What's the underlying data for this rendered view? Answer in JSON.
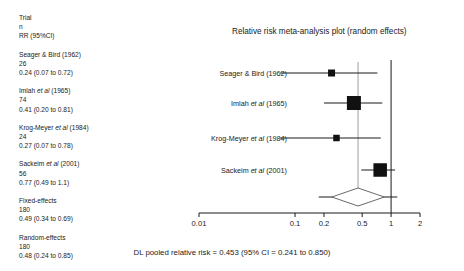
{
  "plot": {
    "title": "Relative risk meta-analysis plot (random effects)",
    "caption": "DL pooled relative risk = 0.453  (95% CI = 0.241 to 0.850)"
  },
  "legend": {
    "header": {
      "line1": "Trial",
      "line2": "n",
      "line3": "RR (95%CI)"
    },
    "entries": [
      {
        "name": "Seager & Bird (1962)",
        "n": "26",
        "rr": "0.24 (0.07 to 0.72)"
      },
      {
        "name": "Imlah et al (1965)",
        "n": "74",
        "rr": "0.41 (0.20 to 0.81)"
      },
      {
        "name": "Krog-Meyer et al (1984)",
        "n": "24",
        "rr": "0.27 (0.07 to 0.78)"
      },
      {
        "name": "Sackeim et al (2001)",
        "n": "56",
        "rr": "0.77 (0.49 to 1.1)"
      },
      {
        "name": "Fixed-effects",
        "n": "180",
        "rr": "0.49 (0.34 to 0.69)"
      },
      {
        "name": "Random-effects",
        "n": "180",
        "rr": "0.48 (0.24 to 0.85)"
      }
    ]
  },
  "chart_data": {
    "type": "forest",
    "title": "Relative risk meta-analysis plot (random effects)",
    "xlabel": "",
    "ylabel": "",
    "xscale": "log",
    "xlim": [
      0.01,
      2
    ],
    "grid": false,
    "null_line": 1,
    "tick_values": [
      0.01,
      0.1,
      0.2,
      0.5,
      1,
      2
    ],
    "tick_labels": [
      "0.01",
      "0.1",
      "0.2",
      "0.5",
      "1",
      "2"
    ],
    "measure": "Relative risk",
    "studies": [
      {
        "label": "Seager & Bird (1962)",
        "n": 26,
        "estimate": 0.24,
        "ci_low": 0.07,
        "ci_high": 0.72,
        "weight": 0.14
      },
      {
        "label": "Imlah et al (1965)",
        "n": 74,
        "estimate": 0.41,
        "ci_low": 0.2,
        "ci_high": 0.81,
        "weight": 0.38
      },
      {
        "label": "Krog-Meyer et al (1984)",
        "n": 24,
        "estimate": 0.27,
        "ci_low": 0.07,
        "ci_high": 0.78,
        "weight": 0.11
      },
      {
        "label": "Sackeim et al (2001)",
        "n": 56,
        "estimate": 0.77,
        "ci_low": 0.49,
        "ci_high": 1.1,
        "weight": 0.37
      }
    ],
    "pooled": {
      "label": "DL pooled relative risk",
      "model": "random effects (DerSimonian-Laird)",
      "estimate": 0.453,
      "ci_low": 0.241,
      "ci_high": 0.85,
      "n": 180
    },
    "fixed_effects": {
      "label": "Fixed-effects",
      "n": 180,
      "estimate": 0.49,
      "ci_low": 0.34,
      "ci_high": 0.69
    },
    "random_effects": {
      "label": "Random-effects",
      "n": 180,
      "estimate": 0.48,
      "ci_low": 0.24,
      "ci_high": 0.85
    }
  }
}
